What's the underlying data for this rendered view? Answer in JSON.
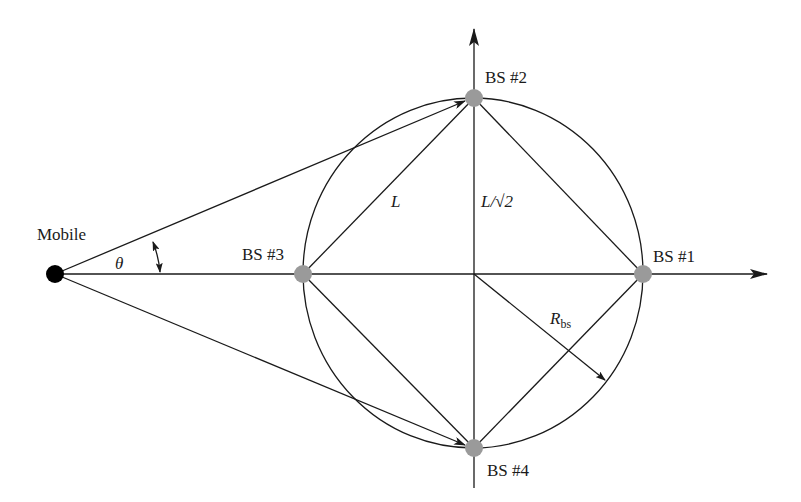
{
  "diagram": {
    "type": "geometry",
    "colors": {
      "line": "#1a1a1a",
      "base_station": "#9a9a9a",
      "mobile": "#000000",
      "background": "#ffffff"
    },
    "nodes": {
      "mobile": {
        "label": "Mobile"
      },
      "bs1": {
        "label": "BS #1"
      },
      "bs2": {
        "label": "BS #2"
      },
      "bs3": {
        "label": "BS #3"
      },
      "bs4": {
        "label": "BS #4"
      }
    },
    "annotations": {
      "theta": "θ",
      "side_length": "L",
      "half_diag": "L/√2",
      "radius_main": "R",
      "radius_sub": "bs"
    }
  }
}
